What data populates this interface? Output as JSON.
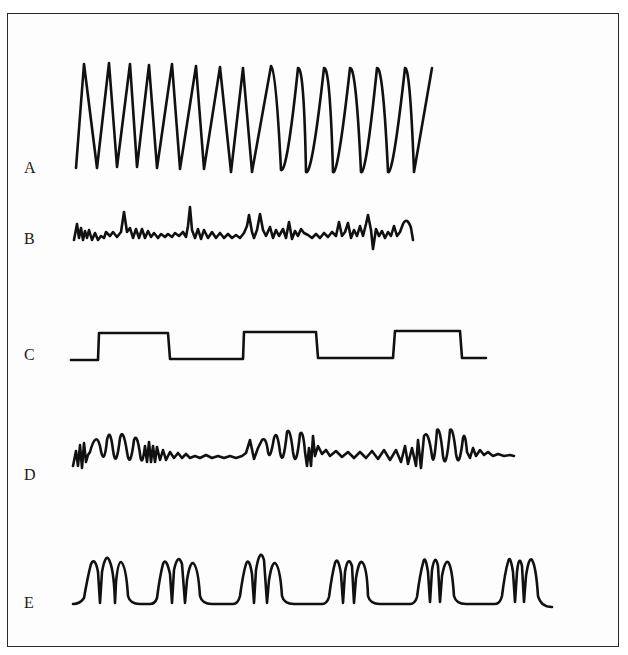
{
  "figure": {
    "type": "waveform-comparison",
    "panels": [
      {
        "label": "A",
        "description": "regular high-amplitude sawtooth/sine-like oscillation, ~14 cycles"
      },
      {
        "label": "B",
        "description": "low-amplitude irregular noise with occasional spikes"
      },
      {
        "label": "C",
        "description": "square wave, three high pulses"
      },
      {
        "label": "D",
        "description": "bursts of high-amplitude oscillation separated by low-amplitude irregular activity"
      },
      {
        "label": "E",
        "description": "periodic groups of three peaks separated by flat baseline, six groups"
      }
    ]
  },
  "colors": {
    "stroke": "#111111",
    "background": "#ffffff",
    "frame": "#2a2a2a"
  }
}
